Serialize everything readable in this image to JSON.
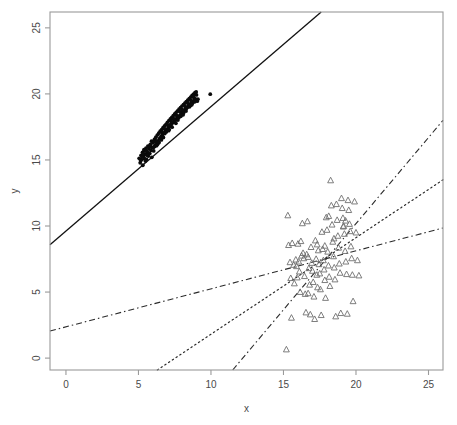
{
  "chart_data": {
    "type": "scatter",
    "title": "",
    "xlabel": "x",
    "ylabel": "y",
    "xlim": [
      -1.1,
      26.0
    ],
    "ylim": [
      -0.9,
      26.2
    ],
    "xticks": [
      0,
      5,
      10,
      15,
      20,
      25
    ],
    "yticks": [
      0,
      5,
      10,
      15,
      20,
      25
    ],
    "xticklabels": [
      "0",
      "5",
      "10",
      "15",
      "20",
      "25"
    ],
    "yticklabels": [
      "0",
      "5",
      "10",
      "15",
      "20",
      "25"
    ],
    "grid": false,
    "legend": "none",
    "series": [
      {
        "name": "group-1-filled-dots",
        "marker": "filled-circle",
        "color": "#0a0a0a",
        "points": [
          [
            5.05,
            15.12
          ],
          [
            5.12,
            14.78
          ],
          [
            5.18,
            15.35
          ],
          [
            5.22,
            15.02
          ],
          [
            5.28,
            15.58
          ],
          [
            5.3,
            14.6
          ],
          [
            5.35,
            15.26
          ],
          [
            5.4,
            15.7
          ],
          [
            5.42,
            15.1
          ],
          [
            5.48,
            15.44
          ],
          [
            5.52,
            15.9
          ],
          [
            5.55,
            15.05
          ],
          [
            5.6,
            15.62
          ],
          [
            5.65,
            16.05
          ],
          [
            5.68,
            15.3
          ],
          [
            5.72,
            15.85
          ],
          [
            5.78,
            15.48
          ],
          [
            5.82,
            16.18
          ],
          [
            5.86,
            15.72
          ],
          [
            5.9,
            16.42
          ],
          [
            5.95,
            15.95
          ],
          [
            6.0,
            16.3
          ],
          [
            6.05,
            15.68
          ],
          [
            6.1,
            16.55
          ],
          [
            6.15,
            16.1
          ],
          [
            6.2,
            16.72
          ],
          [
            6.26,
            16.28
          ],
          [
            6.3,
            16.88
          ],
          [
            6.35,
            16.45
          ],
          [
            6.4,
            17.02
          ],
          [
            6.45,
            16.62
          ],
          [
            6.5,
            17.18
          ],
          [
            6.55,
            16.78
          ],
          [
            6.6,
            17.3
          ],
          [
            6.66,
            16.92
          ],
          [
            6.7,
            17.45
          ],
          [
            6.75,
            17.05
          ],
          [
            6.8,
            17.58
          ],
          [
            6.85,
            17.2
          ],
          [
            6.9,
            17.7
          ],
          [
            6.95,
            17.32
          ],
          [
            7.0,
            17.85
          ],
          [
            7.05,
            17.42
          ],
          [
            7.1,
            17.98
          ],
          [
            7.15,
            17.55
          ],
          [
            7.2,
            18.1
          ],
          [
            7.25,
            17.66
          ],
          [
            7.3,
            18.22
          ],
          [
            7.35,
            17.8
          ],
          [
            7.4,
            18.35
          ],
          [
            7.45,
            17.92
          ],
          [
            7.5,
            18.48
          ],
          [
            7.55,
            18.05
          ],
          [
            7.6,
            18.6
          ],
          [
            7.65,
            18.18
          ],
          [
            7.7,
            18.72
          ],
          [
            7.75,
            18.28
          ],
          [
            7.8,
            18.85
          ],
          [
            7.86,
            18.4
          ],
          [
            7.9,
            18.95
          ],
          [
            7.95,
            18.52
          ],
          [
            8.0,
            19.08
          ],
          [
            8.05,
            18.64
          ],
          [
            8.1,
            19.18
          ],
          [
            8.15,
            18.75
          ],
          [
            8.2,
            19.3
          ],
          [
            8.25,
            18.86
          ],
          [
            8.3,
            19.42
          ],
          [
            8.35,
            18.98
          ],
          [
            8.4,
            19.52
          ],
          [
            8.45,
            19.1
          ],
          [
            8.5,
            19.64
          ],
          [
            8.55,
            19.2
          ],
          [
            8.6,
            19.75
          ],
          [
            8.65,
            19.32
          ],
          [
            8.7,
            19.88
          ],
          [
            8.75,
            19.42
          ],
          [
            8.8,
            19.98
          ],
          [
            8.85,
            19.55
          ],
          [
            8.9,
            20.1
          ],
          [
            5.25,
            15.25
          ],
          [
            5.48,
            14.92
          ],
          [
            5.7,
            15.52
          ],
          [
            5.92,
            15.2
          ],
          [
            6.12,
            16.02
          ],
          [
            6.32,
            16.18
          ],
          [
            6.52,
            16.6
          ],
          [
            6.72,
            16.7
          ],
          [
            6.92,
            17.12
          ],
          [
            7.12,
            17.3
          ],
          [
            7.32,
            17.48
          ],
          [
            7.52,
            17.98
          ],
          [
            7.72,
            18.02
          ],
          [
            7.92,
            18.3
          ],
          [
            8.12,
            18.58
          ],
          [
            8.32,
            18.92
          ],
          [
            8.52,
            19.02
          ],
          [
            8.72,
            19.3
          ],
          [
            8.92,
            19.62
          ],
          [
            9.05,
            19.45
          ],
          [
            5.38,
            15.78
          ],
          [
            5.6,
            15.35
          ],
          [
            5.82,
            16.12
          ],
          [
            6.02,
            15.92
          ],
          [
            6.22,
            16.45
          ],
          [
            6.42,
            16.32
          ],
          [
            6.62,
            17.08
          ],
          [
            6.82,
            17.0
          ],
          [
            7.02,
            17.62
          ],
          [
            7.22,
            17.7
          ],
          [
            7.42,
            18.12
          ],
          [
            7.62,
            18.38
          ],
          [
            7.82,
            18.68
          ],
          [
            8.02,
            18.8
          ],
          [
            8.22,
            19.05
          ],
          [
            8.42,
            19.28
          ],
          [
            8.62,
            19.5
          ],
          [
            8.82,
            19.7
          ],
          [
            9.0,
            19.92
          ],
          [
            9.95,
            19.98
          ],
          [
            5.15,
            14.95
          ],
          [
            5.55,
            15.68
          ],
          [
            6.08,
            16.38
          ],
          [
            6.58,
            16.52
          ],
          [
            7.08,
            17.22
          ],
          [
            7.58,
            17.78
          ],
          [
            8.08,
            18.42
          ],
          [
            8.58,
            19.12
          ],
          [
            8.88,
            19.4
          ],
          [
            9.1,
            19.6
          ],
          [
            5.33,
            15.48
          ],
          [
            5.75,
            15.98
          ],
          [
            6.25,
            16.08
          ],
          [
            6.78,
            17.38
          ],
          [
            7.28,
            17.9
          ],
          [
            7.78,
            18.2
          ],
          [
            8.28,
            18.7
          ],
          [
            8.68,
            19.18
          ],
          [
            8.78,
            19.82
          ],
          [
            8.98,
            20.15
          ]
        ]
      },
      {
        "name": "group-2-open-triangles",
        "marker": "open-triangle",
        "color": "#6f6f6f",
        "points": [
          [
            15.3,
            10.8
          ],
          [
            15.35,
            8.55
          ],
          [
            15.45,
            7.25
          ],
          [
            15.5,
            6.05
          ],
          [
            15.55,
            3.05
          ],
          [
            15.2,
            0.65
          ],
          [
            15.6,
            8.7
          ],
          [
            15.7,
            7.05
          ],
          [
            15.75,
            5.65
          ],
          [
            15.85,
            7.45
          ],
          [
            15.9,
            6.95
          ],
          [
            16.0,
            8.65
          ],
          [
            16.05,
            7.3
          ],
          [
            16.1,
            6.55
          ],
          [
            16.15,
            5.0
          ],
          [
            16.25,
            7.75
          ],
          [
            16.3,
            10.2
          ],
          [
            16.35,
            7.95
          ],
          [
            16.4,
            7.55
          ],
          [
            16.45,
            6.2
          ],
          [
            16.5,
            4.85
          ],
          [
            16.55,
            3.45
          ],
          [
            16.6,
            7.85
          ],
          [
            16.65,
            10.35
          ],
          [
            16.7,
            7.65
          ],
          [
            16.75,
            6.8
          ],
          [
            16.8,
            5.55
          ],
          [
            16.85,
            3.3
          ],
          [
            16.9,
            8.4
          ],
          [
            16.95,
            7.2
          ],
          [
            17.0,
            6.6
          ],
          [
            17.05,
            5.75
          ],
          [
            17.1,
            4.65
          ],
          [
            17.15,
            2.95
          ],
          [
            17.2,
            8.9
          ],
          [
            17.25,
            7.5
          ],
          [
            17.3,
            6.3
          ],
          [
            17.35,
            5.35
          ],
          [
            17.4,
            8.15
          ],
          [
            17.45,
            7.1
          ],
          [
            17.5,
            6.4
          ],
          [
            17.55,
            5.2
          ],
          [
            17.6,
            3.25
          ],
          [
            17.65,
            9.55
          ],
          [
            17.7,
            8.25
          ],
          [
            17.75,
            7.4
          ],
          [
            17.8,
            6.7
          ],
          [
            17.85,
            5.9
          ],
          [
            17.9,
            4.55
          ],
          [
            17.95,
            10.65
          ],
          [
            18.0,
            9.7
          ],
          [
            18.05,
            8.05
          ],
          [
            18.1,
            7.0
          ],
          [
            18.15,
            6.15
          ],
          [
            18.2,
            5.45
          ],
          [
            18.25,
            13.45
          ],
          [
            18.3,
            11.55
          ],
          [
            18.35,
            10.1
          ],
          [
            18.4,
            8.8
          ],
          [
            18.45,
            7.7
          ],
          [
            18.5,
            6.85
          ],
          [
            18.55,
            5.95
          ],
          [
            18.6,
            3.15
          ],
          [
            18.65,
            11.65
          ],
          [
            18.7,
            10.45
          ],
          [
            18.75,
            9.25
          ],
          [
            18.8,
            8.35
          ],
          [
            18.85,
            7.15
          ],
          [
            18.9,
            6.45
          ],
          [
            18.95,
            3.4
          ],
          [
            19.0,
            12.1
          ],
          [
            19.05,
            11.35
          ],
          [
            19.1,
            10.6
          ],
          [
            19.15,
            10.0
          ],
          [
            19.2,
            9.4
          ],
          [
            19.25,
            8.1
          ],
          [
            19.3,
            7.3
          ],
          [
            19.35,
            6.35
          ],
          [
            19.4,
            3.35
          ],
          [
            19.45,
            11.95
          ],
          [
            19.5,
            11.2
          ],
          [
            19.55,
            10.15
          ],
          [
            19.6,
            9.6
          ],
          [
            19.65,
            8.45
          ],
          [
            19.7,
            7.55
          ],
          [
            19.75,
            6.3
          ],
          [
            19.8,
            4.3
          ],
          [
            19.9,
            11.85
          ],
          [
            20.0,
            9.5
          ],
          [
            20.1,
            7.4
          ],
          [
            20.2,
            6.25
          ],
          [
            16.2,
            8.85
          ],
          [
            17.32,
            8.6
          ],
          [
            18.12,
            10.75
          ],
          [
            19.12,
            9.95
          ],
          [
            16.7,
            4.9
          ],
          [
            17.85,
            8.5
          ],
          [
            18.48,
            9.05
          ],
          [
            19.28,
            10.4
          ],
          [
            15.95,
            6.1
          ]
        ]
      }
    ],
    "lines": [
      {
        "name": "regression-line-solid",
        "style": "solid",
        "from": [
          -1.1,
          8.58
        ],
        "to": [
          17.6,
          26.2
        ]
      },
      {
        "name": "regression-line-dashed-steep",
        "style": "dashed",
        "from": [
          11.5,
          -0.9
        ],
        "to": [
          26.0,
          18.0
        ]
      },
      {
        "name": "regression-line-dotted-mid",
        "style": "dotted",
        "from": [
          6.3,
          -0.9
        ],
        "to": [
          26.0,
          13.5
        ]
      },
      {
        "name": "regression-line-dashdot-shallow",
        "style": "dashdot",
        "from": [
          -1.1,
          2.05
        ],
        "to": [
          26.0,
          9.85
        ]
      }
    ]
  },
  "axes": {
    "x_title": "x",
    "y_title": "y"
  }
}
